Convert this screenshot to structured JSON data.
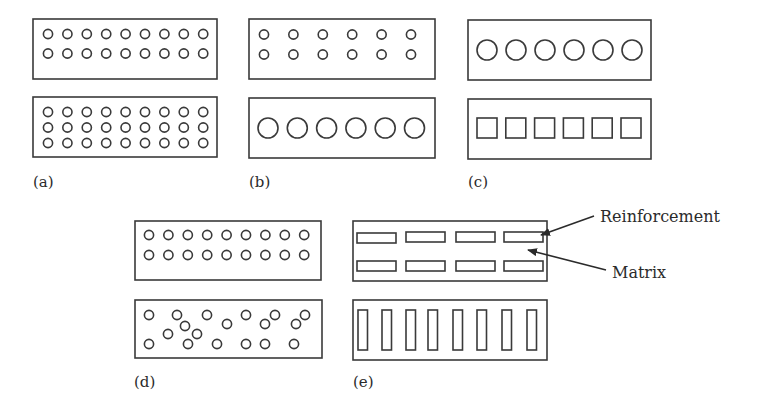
{
  "figure": {
    "colors": {
      "stroke": "#3a3a3a",
      "text": "#2b2b2b",
      "background": "#ffffff"
    },
    "panels": [
      {
        "id": "a",
        "label": "(a)",
        "note": "Same-size circular fibers, 2 rows vs 3 rows (volume fraction)"
      },
      {
        "id": "b",
        "label": "(b)",
        "note": "Small vs large circular fibers (size)"
      },
      {
        "id": "c",
        "label": "(c)",
        "note": "Circular vs square fibers (shape)"
      },
      {
        "id": "d",
        "label": "(d)",
        "note": "Regular vs random distribution"
      },
      {
        "id": "e",
        "label": "(e)",
        "note": "Horizontal vs vertical orientation of elongated reinforcement"
      }
    ],
    "annotations": {
      "reinforcement": "Reinforcement",
      "matrix": "Matrix"
    }
  }
}
